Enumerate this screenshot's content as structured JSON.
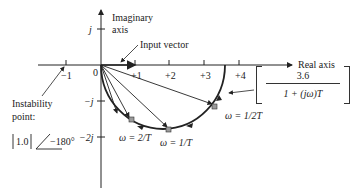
{
  "diagram": {
    "type": "nyquist-polar-plot",
    "axes": {
      "imaginary_label_line1": "Imaginary",
      "imaginary_label_line2": "axis",
      "real_label": "Real axis",
      "real_ticks": [
        "−1",
        "0",
        "+1",
        "+2",
        "+3",
        "+4"
      ],
      "imag_ticks": [
        "j",
        "−j",
        "−2j"
      ]
    },
    "annotations": {
      "input_vector": "Input vector",
      "instability_line1": "Instability",
      "instability_line2": "point:",
      "instability_mag": "1.0",
      "instability_angle": "−180°",
      "omega_half": "ω = 1/2T",
      "omega_one": "ω = 1/T",
      "omega_two": "ω = 2/T"
    },
    "transfer_function": {
      "numerator": "3.6",
      "denominator": "1 + (jω)T"
    },
    "colors": {
      "line": "#222222",
      "marker_fill": "#9a9a9a"
    }
  }
}
